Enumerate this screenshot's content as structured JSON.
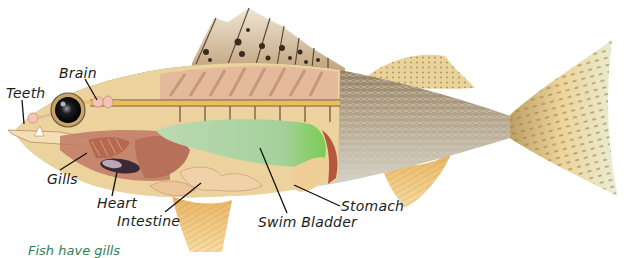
{
  "diagram": {
    "labels": [
      {
        "id": "teeth",
        "text": "Teeth"
      },
      {
        "id": "brain",
        "text": "Brain"
      },
      {
        "id": "gills",
        "text": "Gills"
      },
      {
        "id": "heart",
        "text": "Heart"
      },
      {
        "id": "intestine",
        "text": "Intestine"
      },
      {
        "id": "swim_bladder",
        "text": "Swim Bladder"
      },
      {
        "id": "stomach",
        "text": "Stomach"
      }
    ],
    "caption": "Fish have gills",
    "colors": {
      "body_skin": "#b9ab8e",
      "cutaway_flesh": "#eacf98",
      "swim_bladder": "#a8d4a0",
      "gills": "#b46a4e",
      "heart": "#3a2a35",
      "fin": "#eec277",
      "caption_green": "#2f7f57"
    }
  }
}
